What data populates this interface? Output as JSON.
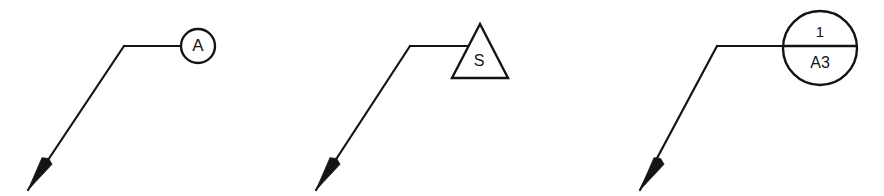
{
  "drawing": {
    "title": "Leader-line reference marker symbols",
    "background_color": "#ffffff",
    "line_color": "#141414",
    "width": 884,
    "height": 196,
    "stroke_width": 2.2
  },
  "symbols": [
    {
      "id": "symbol-circle-a",
      "shape": "circle",
      "label": "A",
      "label_position": "center",
      "geometry": {
        "center_x": 198,
        "center_y": 46,
        "radius": 17
      },
      "leader": {
        "elbow_x": 124,
        "elbow_y": 46,
        "attach_x": 181,
        "attach_y": 46,
        "arrow_tip_x": 28,
        "arrow_tip_y": 190,
        "arrow_base_x": 47,
        "arrow_base_y": 161
      }
    },
    {
      "id": "symbol-triangle-s",
      "shape": "triangle",
      "label": "S",
      "label_position": "center",
      "geometry": {
        "apex_x": 480,
        "apex_y": 24,
        "base_left_x": 452,
        "base_left_y": 78,
        "base_right_x": 508,
        "base_right_y": 78,
        "label_x": 479,
        "label_y": 62
      },
      "leader": {
        "elbow_x": 410,
        "elbow_y": 46,
        "attach_x": 469,
        "attach_y": 46,
        "arrow_tip_x": 316,
        "arrow_tip_y": 190,
        "arrow_base_x": 335,
        "arrow_base_y": 161
      }
    },
    {
      "id": "symbol-circle-divided-a3",
      "shape": "divided-circle",
      "label_top": "1",
      "label_bottom": "A3",
      "geometry": {
        "center_x": 820,
        "center_y": 48,
        "radius": 37,
        "divider_y": 46,
        "divider_left_x": 783,
        "divider_right_x": 858,
        "label_top_x": 820,
        "label_top_y": 33,
        "label_bottom_x": 820,
        "label_bottom_y": 64
      },
      "leader": {
        "elbow_x": 717,
        "elbow_y": 46,
        "attach_x": 784,
        "attach_y": 46,
        "arrow_tip_x": 640,
        "arrow_tip_y": 190,
        "arrow_base_x": 659,
        "arrow_base_y": 161
      }
    }
  ]
}
